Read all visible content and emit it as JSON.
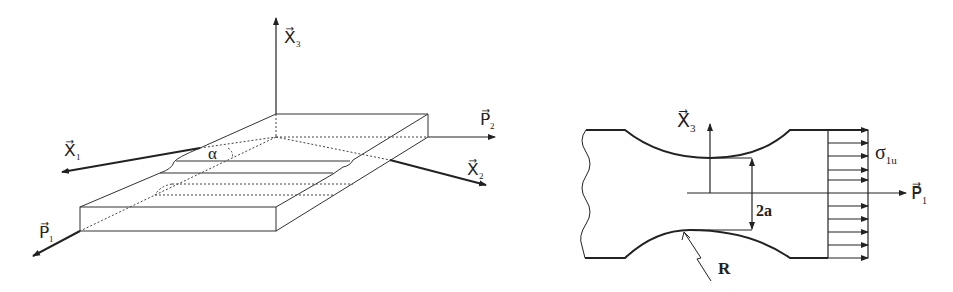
{
  "left_figure": {
    "axes": {
      "x1": "X⃗",
      "x1_sub": "1",
      "x2": "X⃗",
      "x2_sub": "2",
      "x3": "X⃗",
      "x3_sub": "3",
      "p1": "P⃗",
      "p1_sub": "1",
      "p2": "P⃗",
      "p2_sub": "2"
    },
    "angle_label": "α"
  },
  "right_figure": {
    "axes": {
      "x3": "X⃗",
      "x3_sub": "3",
      "p1": "P⃗",
      "p1_sub": "1"
    },
    "stress_label": "σ",
    "stress_sub": "1u",
    "dimension_label": "2a",
    "radius_label": "R"
  },
  "colors": {
    "line": "#222222",
    "background": "#ffffff"
  }
}
